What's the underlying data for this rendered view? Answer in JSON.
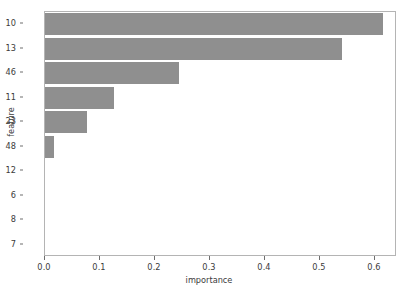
{
  "chart_data": {
    "type": "bar",
    "orientation": "horizontal",
    "title": "",
    "xlabel": "importance",
    "ylabel": "feature",
    "categories": [
      "10",
      "13",
      "46",
      "11",
      "23",
      "48",
      "12",
      "6",
      "8",
      "7"
    ],
    "values": [
      0.614,
      0.54,
      0.244,
      0.125,
      0.076,
      0.016,
      0.0,
      0.0,
      0.0,
      0.0
    ],
    "xlim": [
      0.0,
      0.64
    ],
    "xticks": [
      "0.0",
      "0.1",
      "0.2",
      "0.3",
      "0.4",
      "0.5",
      "0.6"
    ],
    "xtick_values": [
      0.0,
      0.1,
      0.2,
      0.3,
      0.4,
      0.5,
      0.6
    ],
    "grid": false,
    "legend": null,
    "bar_color": "#8f8f8f",
    "axes_color": "#b4b4b4",
    "text_color": "#3b3b3b",
    "background": "#ffffff"
  }
}
